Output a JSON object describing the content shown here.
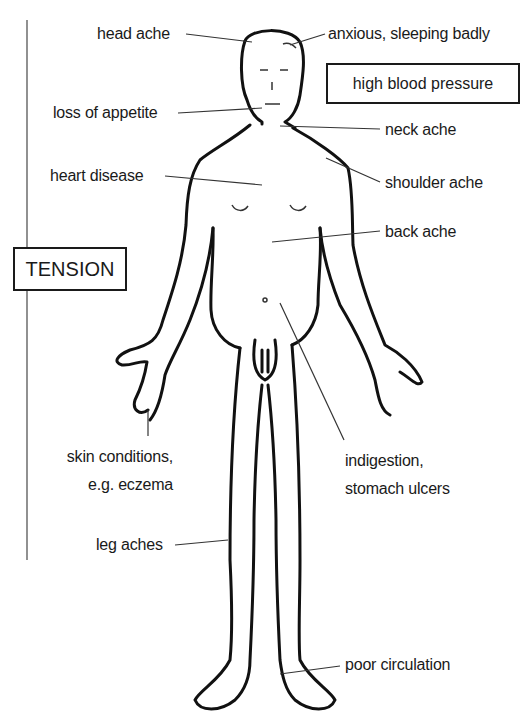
{
  "diagram": {
    "category_box": "TENSION",
    "highlight_box": "high blood pressure",
    "labels": {
      "head_ache": "head ache",
      "anxious": "anxious, sleeping badly",
      "loss_of_appetite": "loss of appetite",
      "neck_ache": "neck ache",
      "heart_disease": "heart disease",
      "shoulder_ache": "shoulder ache",
      "back_ache": "back ache",
      "skin_conditions_1": "skin conditions,",
      "skin_conditions_2": "e.g. eczema",
      "indigestion_1": "indigestion,",
      "indigestion_2": "stomach ulcers",
      "leg_aches": "leg aches",
      "poor_circulation": "poor circulation"
    },
    "colors": {
      "ink": "#1a1a1a",
      "background": "#ffffff"
    }
  }
}
